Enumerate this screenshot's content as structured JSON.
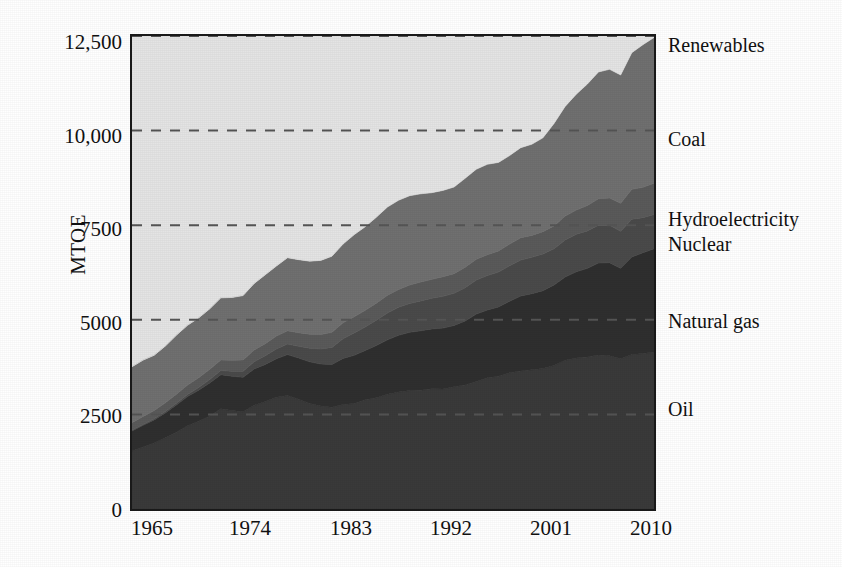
{
  "chart_data": {
    "type": "area",
    "stacked": true,
    "title": "",
    "subtitle": "",
    "xlabel": "",
    "ylabel": "MTOE",
    "xlim": [
      1965,
      2012
    ],
    "ylim": [
      0,
      12500
    ],
    "grid": "horizontal-dashed",
    "legend_position": "right-inline-labels",
    "y_ticks": [
      "0",
      "2500",
      "5000",
      "7500",
      "10,000",
      "12,500"
    ],
    "y_tick_values": [
      0,
      2500,
      5000,
      7500,
      10000,
      12500
    ],
    "x_ticks": [
      "1965",
      "1974",
      "1983",
      "1992",
      "2001",
      "2010"
    ],
    "x_tick_values": [
      1965,
      1974,
      1983,
      1992,
      2001,
      2010
    ],
    "x": [
      1965,
      1966,
      1967,
      1968,
      1969,
      1970,
      1971,
      1972,
      1973,
      1974,
      1975,
      1976,
      1977,
      1978,
      1979,
      1980,
      1981,
      1982,
      1983,
      1984,
      1985,
      1986,
      1987,
      1988,
      1989,
      1990,
      1991,
      1992,
      1993,
      1994,
      1995,
      1996,
      1997,
      1998,
      1999,
      2000,
      2001,
      2002,
      2003,
      2004,
      2005,
      2006,
      2007,
      2008,
      2009,
      2010,
      2011,
      2012
    ],
    "series": [
      {
        "name": "Oil",
        "color": "#3a3a3a",
        "values": [
          1530,
          1640,
          1745,
          1880,
          2030,
          2200,
          2320,
          2460,
          2650,
          2600,
          2570,
          2740,
          2840,
          2950,
          3000,
          2900,
          2790,
          2720,
          2690,
          2760,
          2790,
          2890,
          2940,
          3030,
          3090,
          3130,
          3140,
          3180,
          3170,
          3230,
          3280,
          3370,
          3470,
          3510,
          3600,
          3650,
          3680,
          3710,
          3790,
          3930,
          3990,
          4020,
          4070,
          4050,
          3970,
          4080,
          4110,
          4150
        ]
      },
      {
        "name": "Natural gas",
        "color": "#2f2f2f",
        "values": [
          530,
          570,
          610,
          660,
          720,
          770,
          820,
          870,
          900,
          910,
          910,
          960,
          980,
          1020,
          1080,
          1090,
          1100,
          1110,
          1130,
          1220,
          1270,
          1300,
          1380,
          1440,
          1500,
          1540,
          1570,
          1580,
          1610,
          1620,
          1690,
          1780,
          1790,
          1830,
          1890,
          1980,
          2010,
          2060,
          2130,
          2200,
          2280,
          2340,
          2430,
          2460,
          2390,
          2580,
          2660,
          2730
        ]
      },
      {
        "name": "Nuclear",
        "color": "#4a4a4a",
        "values": [
          20,
          25,
          30,
          35,
          45,
          55,
          70,
          90,
          110,
          130,
          160,
          190,
          230,
          260,
          280,
          310,
          360,
          400,
          450,
          520,
          590,
          620,
          670,
          710,
          740,
          760,
          790,
          810,
          840,
          850,
          880,
          900,
          910,
          920,
          940,
          950,
          960,
          970,
          960,
          980,
          990,
          990,
          1000,
          990,
          980,
          1000,
          930,
          900
        ]
      },
      {
        "name": "Hydroelectricity",
        "color": "#5a5a5a",
        "values": [
          200,
          210,
          220,
          230,
          240,
          250,
          260,
          270,
          280,
          290,
          300,
          310,
          320,
          340,
          350,
          360,
          370,
          380,
          400,
          420,
          430,
          440,
          450,
          470,
          470,
          490,
          500,
          500,
          520,
          520,
          540,
          550,
          550,
          560,
          570,
          590,
          580,
          590,
          600,
          630,
          640,
          670,
          700,
          720,
          740,
          790,
          800,
          830
        ]
      },
      {
        "name": "Coal",
        "color": "#707070",
        "values": [
          1480,
          1490,
          1460,
          1500,
          1560,
          1580,
          1580,
          1600,
          1640,
          1660,
          1700,
          1760,
          1820,
          1850,
          1930,
          1930,
          1930,
          1960,
          2010,
          2080,
          2170,
          2210,
          2270,
          2330,
          2360,
          2360,
          2330,
          2290,
          2280,
          2290,
          2350,
          2380,
          2390,
          2340,
          2340,
          2380,
          2410,
          2480,
          2710,
          2900,
          3060,
          3210,
          3350,
          3400,
          3390,
          3610,
          3770,
          3850
        ]
      },
      {
        "name": "Renewables",
        "color": "#e4e4e4",
        "values": [
          5,
          5,
          5,
          6,
          6,
          7,
          7,
          8,
          8,
          9,
          9,
          10,
          11,
          12,
          13,
          14,
          15,
          16,
          17,
          18,
          20,
          21,
          23,
          25,
          27,
          29,
          31,
          33,
          35,
          37,
          40,
          43,
          46,
          50,
          55,
          60,
          65,
          72,
          80,
          90,
          102,
          118,
          138,
          162,
          180,
          215,
          250,
          290
        ]
      }
    ],
    "background_color": "#e4e4e4",
    "axis_color": "#1a1a1a",
    "gridline_color": "#555555"
  },
  "axes": {
    "y_title": "MTOE",
    "y_tick_labels": [
      {
        "text": "12,500",
        "value": 12500
      },
      {
        "text": "10,000",
        "value": 10000
      },
      {
        "text": "7500",
        "value": 7500
      },
      {
        "text": "5000",
        "value": 5000
      },
      {
        "text": "2500",
        "value": 2500
      },
      {
        "text": "0",
        "value": 0
      }
    ],
    "x_tick_labels": [
      {
        "text": "1965",
        "value": 1965
      },
      {
        "text": "1974",
        "value": 1974
      },
      {
        "text": "1983",
        "value": 1983
      },
      {
        "text": "1992",
        "value": 1992
      },
      {
        "text": "2001",
        "value": 2001
      },
      {
        "text": "2010",
        "value": 2010
      }
    ]
  },
  "series_labels": [
    {
      "text": "Renewables",
      "top": 34
    },
    {
      "text": "Coal",
      "top": 128
    },
    {
      "text": "Hydroelectricity",
      "top": 208
    },
    {
      "text": "Nuclear",
      "top": 233
    },
    {
      "text": "Natural gas",
      "top": 310
    },
    {
      "text": "Oil",
      "top": 398
    }
  ]
}
